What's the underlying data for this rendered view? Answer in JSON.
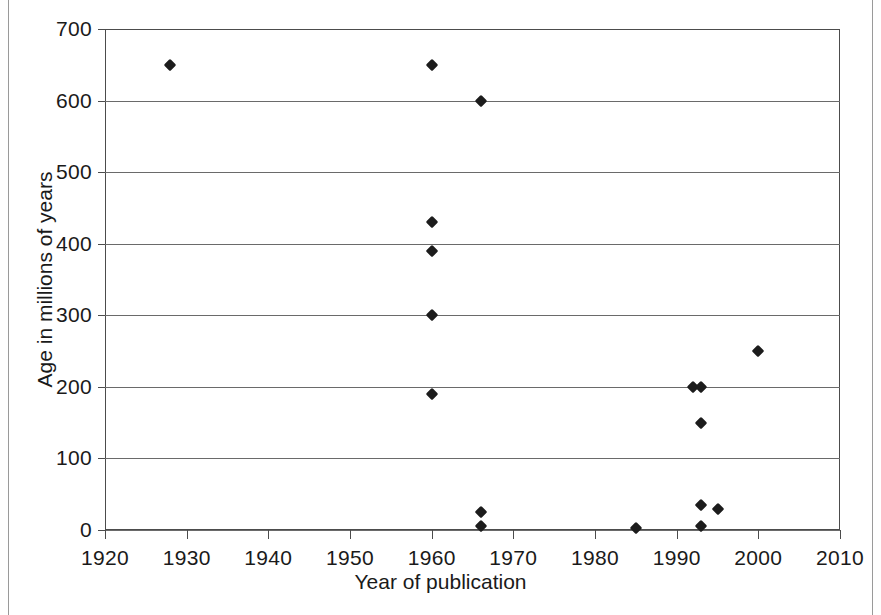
{
  "chart_data": {
    "type": "scatter",
    "title": "",
    "xlabel": "Year of publication",
    "ylabel": "Age in millions of years",
    "xlim": [
      1920,
      2010
    ],
    "ylim": [
      0,
      700
    ],
    "xticks": [
      1920,
      1930,
      1940,
      1950,
      1960,
      1970,
      1980,
      1990,
      2000,
      2010
    ],
    "yticks": [
      0,
      100,
      200,
      300,
      400,
      500,
      600,
      700
    ],
    "grid": "horizontal",
    "legend": "none",
    "marker": "diamond",
    "marker_color": "#1c1c1c",
    "series": [
      {
        "name": "Reported age",
        "x": [
          1928,
          1960,
          1960,
          1960,
          1960,
          1960,
          1966,
          1966,
          1966,
          1985,
          1992,
          1993,
          1993,
          1993,
          1993,
          1995,
          2000
        ],
        "y": [
          650,
          650,
          430,
          390,
          300,
          190,
          600,
          25,
          5,
          3,
          200,
          200,
          150,
          35,
          5,
          30,
          250
        ]
      }
    ],
    "points": [
      {
        "x": 1928,
        "y": 650
      },
      {
        "x": 1960,
        "y": 650
      },
      {
        "x": 1960,
        "y": 430
      },
      {
        "x": 1960,
        "y": 390
      },
      {
        "x": 1960,
        "y": 300
      },
      {
        "x": 1960,
        "y": 190
      },
      {
        "x": 1966,
        "y": 600
      },
      {
        "x": 1966,
        "y": 25
      },
      {
        "x": 1966,
        "y": 5
      },
      {
        "x": 1985,
        "y": 3
      },
      {
        "x": 1992,
        "y": 200
      },
      {
        "x": 1993,
        "y": 200
      },
      {
        "x": 1993,
        "y": 150
      },
      {
        "x": 1993,
        "y": 35
      },
      {
        "x": 1993,
        "y": 5
      },
      {
        "x": 1995,
        "y": 30
      },
      {
        "x": 2000,
        "y": 250
      }
    ]
  }
}
